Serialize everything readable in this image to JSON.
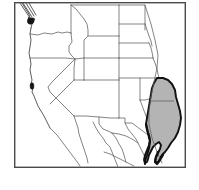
{
  "figure": {
    "kind": "distribution-range-map",
    "title": "Western United States distribution map",
    "width": 199,
    "height": 190,
    "background_color": "#ffffff",
    "frame": {
      "x": 14,
      "y": 2,
      "width": 172,
      "height": 166,
      "stroke_color": "#4a4a4a",
      "fill_color": "#ffffff"
    }
  },
  "legend_colors": {
    "range_fill": "#b4b4b4",
    "range_outline": "#111111",
    "state_boundary": "#5b5b5b",
    "coastline": "#4a4a4a",
    "marker": "#151515",
    "frame": "#4a4a4a"
  },
  "regions": {
    "shaded_range": {
      "name": "texas-gulf-coast-range",
      "label": "Shaded distribution range",
      "fill": "#b4b4b4",
      "outline": "#111111",
      "description": "Continuous gray-shaded range covering Texas and the Gulf coastal plain, with a heavy dark outline tracing the Rio Grande and Gulf of Mexico shoreline."
    },
    "isolated_markers": [
      {
        "name": "puget-sound-marker",
        "label": "Puget Sound population",
        "x": 30,
        "y": 21,
        "color": "#151515"
      },
      {
        "name": "san-francisco-bay-marker",
        "label": "San Francisco Bay population",
        "x": 32,
        "y": 86,
        "color": "#151515"
      }
    ]
  },
  "boundaries": {
    "state_lines_label": "US state boundaries",
    "coastline_label": "Pacific and Gulf coastlines",
    "international_label": "United States - Mexico border"
  }
}
